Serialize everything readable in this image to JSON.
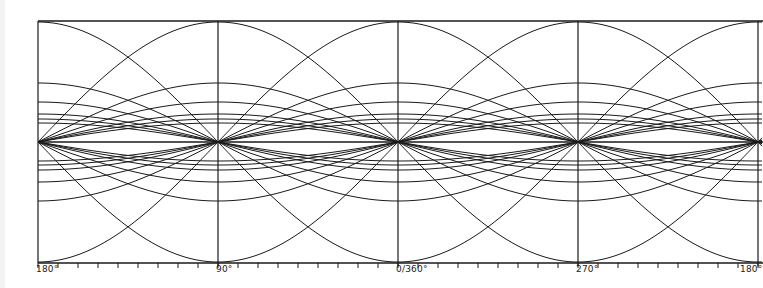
{
  "diagram": {
    "type": "sinusoid-family",
    "colors": {
      "ink": "#1a1a1a",
      "background": "#ffffff"
    },
    "frame": {
      "left": 38,
      "top": 21,
      "right": 758,
      "bottom": 263,
      "center_y": 142
    },
    "pixels_per_90deg": 180,
    "amplitudes_px": [
      120,
      59,
      40,
      28,
      23,
      19
    ],
    "axis_labels": [
      {
        "text": "180°",
        "x": 38
      },
      {
        "text": "90°",
        "x": 218
      },
      {
        "text": "0/360°",
        "x": 398
      },
      {
        "text": "270°",
        "x": 578
      },
      {
        "text": "180°",
        "x": 758
      }
    ],
    "tick_spacing_deg": 10
  }
}
